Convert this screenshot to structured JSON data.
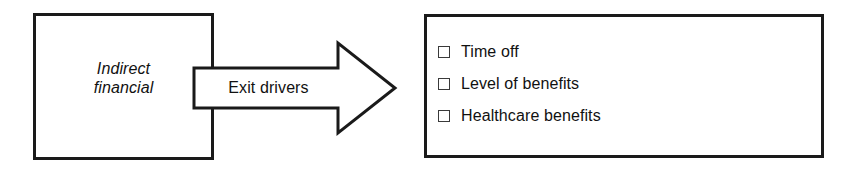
{
  "diagram": {
    "type": "process-flow",
    "background_color": "#ffffff",
    "stroke_color": "#1a1a1a",
    "text_color": "#111111",
    "source_box": {
      "name": "indirect-financial",
      "label_line1": "Indirect",
      "label_line2": "financial",
      "style": "italic",
      "border_color": "#1a1a1a",
      "fill": "#ffffff"
    },
    "arrow": {
      "name": "exit-drivers-arrow",
      "label": "Exit drivers",
      "direction": "right",
      "border_color": "#1a1a1a",
      "fill": "#ffffff"
    },
    "list_box": {
      "name": "exit-drivers-list",
      "border_color": "#1a1a1a",
      "fill": "#ffffff",
      "items": [
        {
          "icon": "checkbox-empty-icon",
          "label": "Time off",
          "checked": false
        },
        {
          "icon": "checkbox-empty-icon",
          "label": "Level of benefits",
          "checked": false
        },
        {
          "icon": "checkbox-empty-icon",
          "label": "Healthcare benefits",
          "checked": false
        }
      ]
    }
  }
}
